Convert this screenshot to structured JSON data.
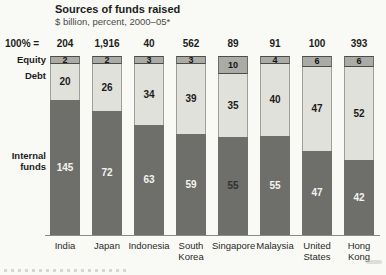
{
  "title": "Sources of funds raised",
  "subtitle": "$ billion, percent, 2000–05*",
  "totals_row_label": "100% =",
  "chart_data": {
    "type": "bar",
    "stacked": true,
    "orientation": "vertical",
    "unit": "percent",
    "totals_unit": "$ billion",
    "title": "Sources of funds raised",
    "subtitle": "$ billion, percent, 2000–05*",
    "categories": [
      "India",
      "Japan",
      "Indonesia",
      "South Korea",
      "Singapore",
      "Malaysia",
      "United States",
      "Hong Kong"
    ],
    "totals": [
      "204",
      "1,916",
      "40",
      "562",
      "89",
      "91",
      "100",
      "393"
    ],
    "series": [
      {
        "name": "Equity",
        "values": [
          2,
          2,
          3,
          3,
          10,
          4,
          6,
          6
        ]
      },
      {
        "name": "Debt",
        "values": [
          20,
          26,
          34,
          39,
          35,
          40,
          47,
          52
        ]
      },
      {
        "name": "Internal funds",
        "values": [
          145,
          72,
          63,
          59,
          55,
          55,
          47,
          42
        ]
      }
    ],
    "legend_position": "left",
    "ylim": [
      0,
      100
    ],
    "grid": false,
    "colors": {
      "equity": "#aaaaa6",
      "debt": "#e1e1dc",
      "internal": "#6e6e6b",
      "internal_text": "#f4f4f1",
      "internal_text_dark_artifact": "#32322f"
    }
  }
}
